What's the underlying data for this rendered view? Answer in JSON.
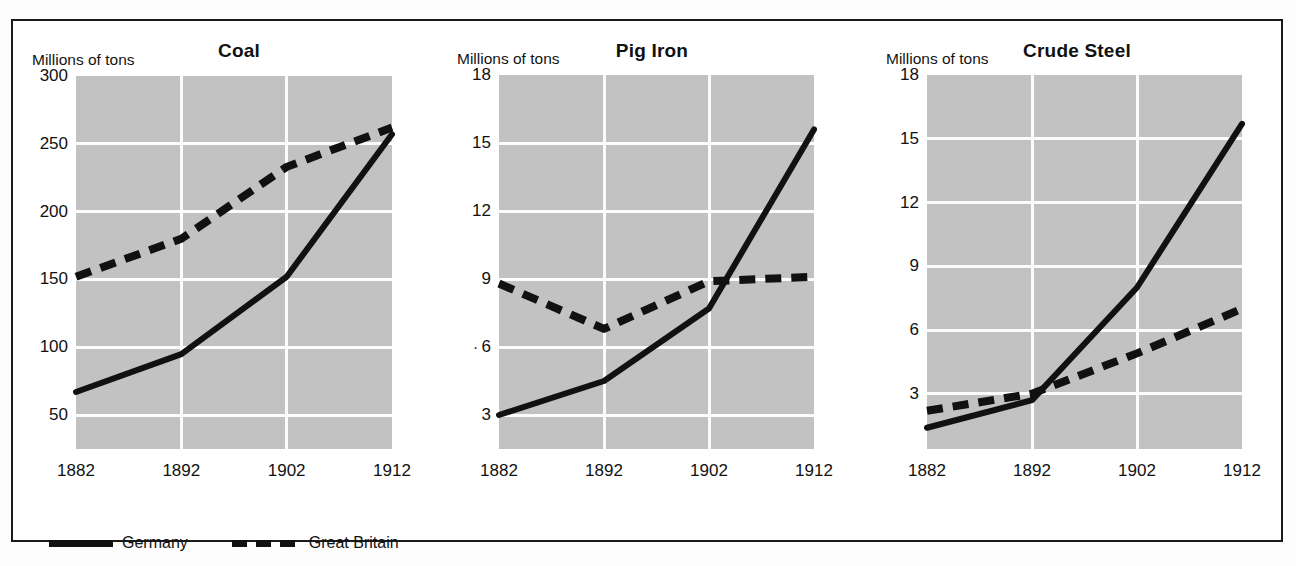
{
  "figure": {
    "background_color": "#ffffff",
    "frame_color": "#1a1a1a",
    "plot_background_color": "#c2c2c2",
    "gridline_color": "#fcfcfc",
    "series_color": "#111111"
  },
  "legend": {
    "position": "bottom-left",
    "entries": [
      {
        "label": "Germany",
        "style": "solid",
        "icon": "solid-line-swatch-icon"
      },
      {
        "label": "Great Britain",
        "style": "dashed",
        "icon": "dashed-line-swatch-icon"
      }
    ]
  },
  "chart_data": [
    {
      "type": "line",
      "title": "Coal",
      "ylabel": "Millions of tons",
      "xlabel": "",
      "grid": true,
      "legend_position": "bottom-left",
      "x": [
        1882,
        1892,
        1902,
        1912
      ],
      "xticklabels": [
        "1882",
        "1892",
        "1902",
        "1912"
      ],
      "yticks": [
        50,
        100,
        150,
        200,
        250,
        300
      ],
      "yticklabels": [
        "50",
        "100",
        "150",
        "200",
        "250",
        "300"
      ],
      "ylim": [
        25,
        300
      ],
      "series": [
        {
          "name": "Germany",
          "style": "solid",
          "values": [
            67,
            95,
            152,
            257
          ]
        },
        {
          "name": "Great Britain",
          "style": "dashed",
          "values": [
            152,
            180,
            233,
            262
          ]
        }
      ]
    },
    {
      "type": "line",
      "title": "Pig Iron",
      "ylabel": "Millions of tons",
      "xlabel": "",
      "grid": true,
      "legend_position": "bottom-left",
      "x": [
        1882,
        1892,
        1902,
        1912
      ],
      "xticklabels": [
        "1882",
        "1892",
        "1902",
        "1912"
      ],
      "yticks": [
        3,
        6,
        9,
        12,
        15,
        18
      ],
      "yticklabels": [
        "3",
        "6",
        "9",
        "12",
        "15",
        "18"
      ],
      "ylim": [
        1.5,
        18
      ],
      "series": [
        {
          "name": "Germany",
          "style": "solid",
          "values": [
            3.0,
            4.5,
            7.7,
            15.6
          ]
        },
        {
          "name": "Great Britain",
          "style": "dashed",
          "values": [
            8.8,
            6.8,
            8.9,
            9.1
          ]
        }
      ]
    },
    {
      "type": "line",
      "title": "Crude Steel",
      "ylabel": "Millions of tons",
      "xlabel": "",
      "grid": true,
      "legend_position": "bottom-left",
      "x": [
        1882,
        1892,
        1902,
        1912
      ],
      "xticklabels": [
        "1882",
        "1892",
        "1902",
        "1912"
      ],
      "yticks": [
        3,
        6,
        9,
        12,
        15,
        18
      ],
      "yticklabels": [
        "3",
        "6",
        "9",
        "12",
        "15",
        "18"
      ],
      "ylim": [
        0.4,
        18
      ],
      "series": [
        {
          "name": "Germany",
          "style": "solid",
          "values": [
            1.4,
            2.7,
            8.0,
            15.7
          ]
        },
        {
          "name": "Great Britain",
          "style": "dashed",
          "values": [
            2.2,
            3.0,
            4.9,
            7.0
          ]
        }
      ]
    }
  ],
  "panels_geometry": [
    {
      "plot_left": 74,
      "plot_top": 74,
      "plot_width": 316,
      "plot_height": 373,
      "title_center": 237,
      "unit_left": 30
    },
    {
      "plot_left": 497,
      "plot_top": 73,
      "plot_width": 315,
      "plot_height": 374,
      "title_center": 650,
      "unit_left": 455
    },
    {
      "plot_left": 925,
      "plot_top": 73,
      "plot_width": 315,
      "plot_height": 374,
      "title_center": 1075,
      "unit_left": 884
    }
  ],
  "artifacts": {
    "pig_iron_tick_dot": "·"
  }
}
